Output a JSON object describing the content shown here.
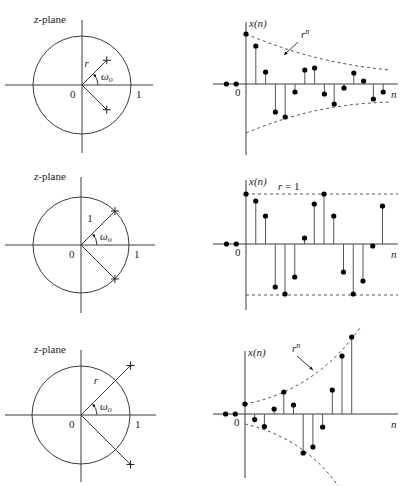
{
  "figure": {
    "rows": [
      {
        "id": "decaying",
        "zplane": {
          "title": "z-plane",
          "center": [
            82,
            85
          ],
          "unit_radius": 49,
          "pole_radius_px": 35,
          "angle_deg": 45,
          "radius_label": "r",
          "angle_label": "ω",
          "angle_sub": "o",
          "origin_label": "0",
          "unit_label": "1",
          "hx": [
            5,
            153
          ],
          "vy": [
            20,
            153
          ],
          "pole_marker": "cross"
        },
        "stem": {
          "axis_x": 246,
          "baseline_y": 84,
          "x_range": [
            213,
            398
          ],
          "y_range": [
            22,
            155
          ],
          "spacing": 9.8,
          "ylabel": "x(n)",
          "xlabel": "n",
          "origin_label": "0",
          "envelope_label": "r",
          "envelope_sup": "n",
          "pre_values": [
            0,
            0
          ],
          "values": [
            50,
            38,
            12,
            -28,
            -33,
            -8,
            14,
            16,
            -10,
            -20,
            -4,
            11,
            3,
            -15,
            -8
          ],
          "envelope": {
            "upper": "M246,34 C290,52 330,64 390,70",
            "lower": "M246,133 C290,115 330,104 390,102"
          },
          "envelope_label_pos": [
            301,
            38
          ],
          "envelope_arrow": [
            [
              298,
              42
            ],
            [
              284,
              55
            ]
          ]
        }
      },
      {
        "id": "constant",
        "zplane": {
          "title": "z-plane",
          "center": [
            81,
            245
          ],
          "unit_radius": 48,
          "pole_radius_px": 48,
          "angle_deg": 45,
          "radius_label": "1",
          "angle_label": "ω",
          "angle_sub": "o",
          "origin_label": "0",
          "unit_label": "1",
          "hx": [
            5,
            155
          ],
          "vy": [
            177,
            313
          ],
          "pole_marker": "cross"
        },
        "stem": {
          "axis_x": 246,
          "baseline_y": 244,
          "x_range": [
            213,
            398
          ],
          "y_range": [
            180,
            310
          ],
          "spacing": 9.75,
          "ylabel": "x(n)",
          "xlabel": "n",
          "origin_label": "0",
          "envelope_label": "r = 1",
          "envelope_sup": "",
          "pre_values": [
            0,
            0
          ],
          "values": [
            50,
            43,
            28,
            -43,
            -50,
            -33,
            6,
            40,
            50,
            28,
            -28,
            -50,
            -37,
            -2,
            38
          ],
          "envelope": {
            "upper": "M246,194 L398,194",
            "lower": "M246,295 L398,295"
          },
          "envelope_label_pos": [
            278,
            190
          ],
          "envelope_arrow": []
        }
      },
      {
        "id": "growing",
        "zplane": {
          "title": "z-plane",
          "center": [
            81,
            415
          ],
          "unit_radius": 49,
          "pole_radius_px": 70,
          "angle_deg": 45,
          "radius_label": "r",
          "angle_label": "ω",
          "angle_sub": "o",
          "origin_label": "0",
          "unit_label": "1",
          "hx": [
            5,
            156
          ],
          "vy": [
            350,
            482
          ],
          "pole_marker": "cross"
        },
        "stem": {
          "axis_x": 245,
          "baseline_y": 414,
          "x_range": [
            213,
            398
          ],
          "y_range": [
            351,
            478
          ],
          "spacing": 9.7,
          "ylabel": "x(n)",
          "xlabel": "n",
          "origin_label": "0",
          "envelope_label": "r",
          "envelope_sup": "n",
          "pre_values": [
            0,
            0
          ],
          "values": [
            10,
            -5.6,
            -12.6,
            5,
            22,
            9,
            -39,
            -33,
            -13,
            24,
            58,
            77
          ],
          "envelope": {
            "upper": "M245,404 C290,396 330,370 360,328",
            "lower": "M245,424 C280,432 315,452 338,486"
          },
          "envelope_label_pos": [
            292,
            352
          ],
          "envelope_arrow": [
            [
              297,
              356
            ],
            [
              313,
              370
            ]
          ]
        }
      }
    ]
  }
}
